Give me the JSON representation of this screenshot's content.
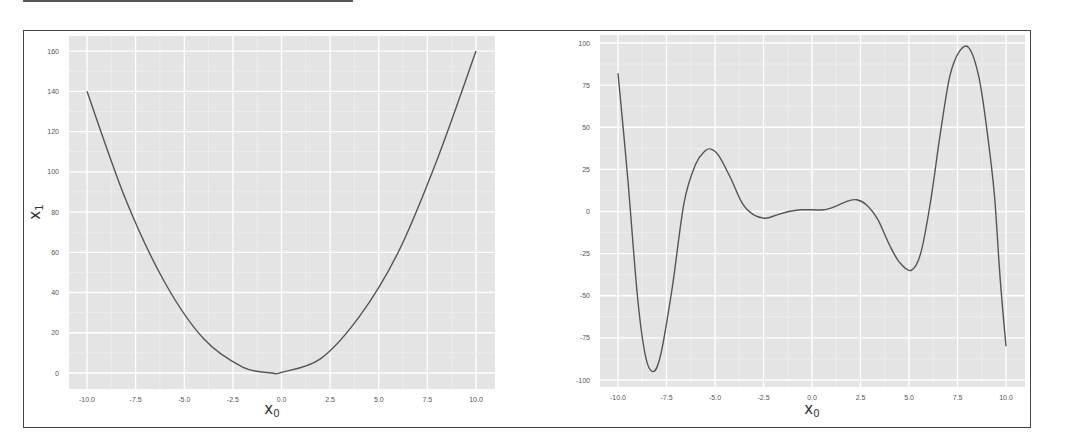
{
  "figure": {
    "panels": 2,
    "plot_background": "#e4e4e4",
    "grid_color": "#ffffff",
    "line_color": "#555555"
  },
  "left": {
    "xlabel_main": "x",
    "xlabel_sub": "0",
    "ylabel_main": "x",
    "ylabel_sub": "1",
    "xticks": [
      "-10.0",
      "-7.5",
      "-5.0",
      "-2.5",
      "0.0",
      "2.5",
      "5.0",
      "7.5",
      "10.0"
    ],
    "yticks": [
      "0",
      "20",
      "40",
      "60",
      "80",
      "100",
      "120",
      "140",
      "160"
    ]
  },
  "right": {
    "xlabel_main": "x",
    "xlabel_sub": "0",
    "xticks": [
      "-10.0",
      "-7.5",
      "-5.0",
      "-2.5",
      "0.0",
      "2.5",
      "5.0",
      "7.5",
      "10.0"
    ],
    "yticks": [
      "-100",
      "-75",
      "-50",
      "-25",
      "0",
      "25",
      "50",
      "75",
      "100"
    ]
  },
  "chart_data": [
    {
      "type": "line",
      "title": "",
      "xlabel": "x_0",
      "ylabel": "x_1",
      "xlim": [
        -11,
        11
      ],
      "ylim": [
        -8,
        168
      ],
      "grid": true,
      "legend": "none",
      "series": [
        {
          "name": "parabola",
          "x": [
            -10,
            -8,
            -6,
            -4,
            -2,
            -0.5,
            0,
            2,
            4,
            6,
            8,
            10
          ],
          "values": [
            140,
            86,
            45,
            17,
            3,
            0,
            0.3,
            7,
            28,
            60,
            106,
            160
          ]
        }
      ],
      "xticks": [
        -10,
        -7.5,
        -5,
        -2.5,
        0,
        2.5,
        5,
        7.5,
        10
      ],
      "yticks": [
        0,
        20,
        40,
        60,
        80,
        100,
        120,
        140,
        160
      ]
    },
    {
      "type": "line",
      "title": "",
      "xlabel": "x_0",
      "ylabel": "",
      "xlim": [
        -11,
        11
      ],
      "ylim": [
        -104,
        106
      ],
      "grid": true,
      "legend": "none",
      "series": [
        {
          "name": "oscillating polynomial",
          "x": [
            -10,
            -9.5,
            -9,
            -8.6,
            -8.2,
            -7.8,
            -7.2,
            -6.6,
            -6.0,
            -5.5,
            -5.2,
            -4.8,
            -4.2,
            -3.6,
            -3.0,
            -2.4,
            -1.8,
            -1.2,
            -0.6,
            0,
            0.6,
            1.2,
            1.8,
            2.3,
            2.8,
            3.4,
            4.0,
            4.5,
            5.1,
            5.6,
            6.1,
            6.6,
            7.1,
            7.6,
            8.1,
            8.6,
            9.0,
            9.4,
            9.7,
            10
          ],
          "values": [
            82,
            20,
            -50,
            -85,
            -95,
            -85,
            -45,
            5,
            28,
            36,
            37,
            33,
            20,
            5,
            -2,
            -4,
            -2,
            0,
            1,
            1,
            1,
            3,
            6,
            7,
            4,
            -5,
            -20,
            -30,
            -35,
            -25,
            5,
            45,
            80,
            95,
            97,
            80,
            50,
            10,
            -40,
            -80
          ]
        }
      ],
      "xticks": [
        -10,
        -7.5,
        -5,
        -2.5,
        0,
        2.5,
        5,
        7.5,
        10
      ],
      "yticks": [
        -100,
        -75,
        -50,
        -25,
        0,
        25,
        50,
        75,
        100
      ]
    }
  ]
}
